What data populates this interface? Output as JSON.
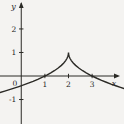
{
  "figure": {
    "background": "#f4f3f1",
    "line_color": "#2b2a26",
    "label_color": "#27251f"
  },
  "chart_data": {
    "type": "line",
    "title": "",
    "xlabel": "x",
    "ylabel": "y",
    "origin_label": "0",
    "grid": false,
    "legend": "none",
    "xlim": [
      -0.9,
      4.35
    ],
    "ylim": [
      -2.04,
      3.23
    ],
    "x_ticks": [
      1,
      2,
      3
    ],
    "y_ticks": [
      2,
      1,
      -1
    ],
    "series": [
      {
        "name": "y = 1 - sqrt(|x - 2|)",
        "points": [
          [
            -0.9,
            -0.703
          ],
          [
            -0.7,
            -0.643
          ],
          [
            -0.5,
            -0.581
          ],
          [
            -0.3,
            -0.517
          ],
          [
            -0.1,
            -0.449
          ],
          [
            0.1,
            -0.378
          ],
          [
            0.3,
            -0.304
          ],
          [
            0.5,
            -0.225
          ],
          [
            0.7,
            -0.14
          ],
          [
            0.9,
            -0.049
          ],
          [
            1.0,
            0.0
          ],
          [
            1.1,
            0.051
          ],
          [
            1.25,
            0.134
          ],
          [
            1.4,
            0.225
          ],
          [
            1.55,
            0.329
          ],
          [
            1.7,
            0.452
          ],
          [
            1.8,
            0.553
          ],
          [
            1.88,
            0.654
          ],
          [
            1.94,
            0.755
          ],
          [
            1.97,
            0.827
          ],
          [
            1.99,
            0.9
          ],
          [
            2.0,
            1.0
          ],
          [
            2.01,
            0.9
          ],
          [
            2.03,
            0.827
          ],
          [
            2.06,
            0.755
          ],
          [
            2.12,
            0.654
          ],
          [
            2.2,
            0.553
          ],
          [
            2.3,
            0.452
          ],
          [
            2.45,
            0.329
          ],
          [
            2.6,
            0.225
          ],
          [
            2.75,
            0.134
          ],
          [
            2.9,
            0.051
          ],
          [
            3.0,
            0.0
          ],
          [
            3.2,
            -0.095
          ],
          [
            3.4,
            -0.183
          ],
          [
            3.6,
            -0.265
          ],
          [
            3.8,
            -0.342
          ],
          [
            4.0,
            -0.414
          ],
          [
            4.2,
            -0.483
          ],
          [
            4.35,
            -0.533
          ]
        ]
      }
    ],
    "key_points": [
      [
        1,
        0
      ],
      [
        2,
        1
      ],
      [
        3,
        0
      ]
    ],
    "cusp": [
      2,
      1
    ]
  }
}
